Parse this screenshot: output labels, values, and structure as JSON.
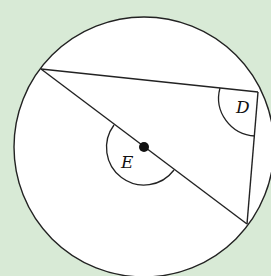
{
  "diagram": {
    "type": "circle-geometry",
    "background_color": "#d8ead6",
    "circle": {
      "center": [
        144,
        147
      ],
      "radius": 130,
      "fill": "#ffffff",
      "stroke": "#222222"
    },
    "center_point": {
      "position": [
        144,
        147
      ]
    },
    "vertices": {
      "top_left": [
        41,
        69
      ],
      "right": [
        258,
        92
      ],
      "bottom_right": [
        247,
        224
      ]
    },
    "labels": {
      "D": "D",
      "E": "E"
    },
    "angles": [
      {
        "label": "D",
        "at": "right",
        "description": "inscribed angle at D"
      },
      {
        "label": "E",
        "at": "center",
        "description": "reflex angle at centre E"
      }
    ]
  }
}
